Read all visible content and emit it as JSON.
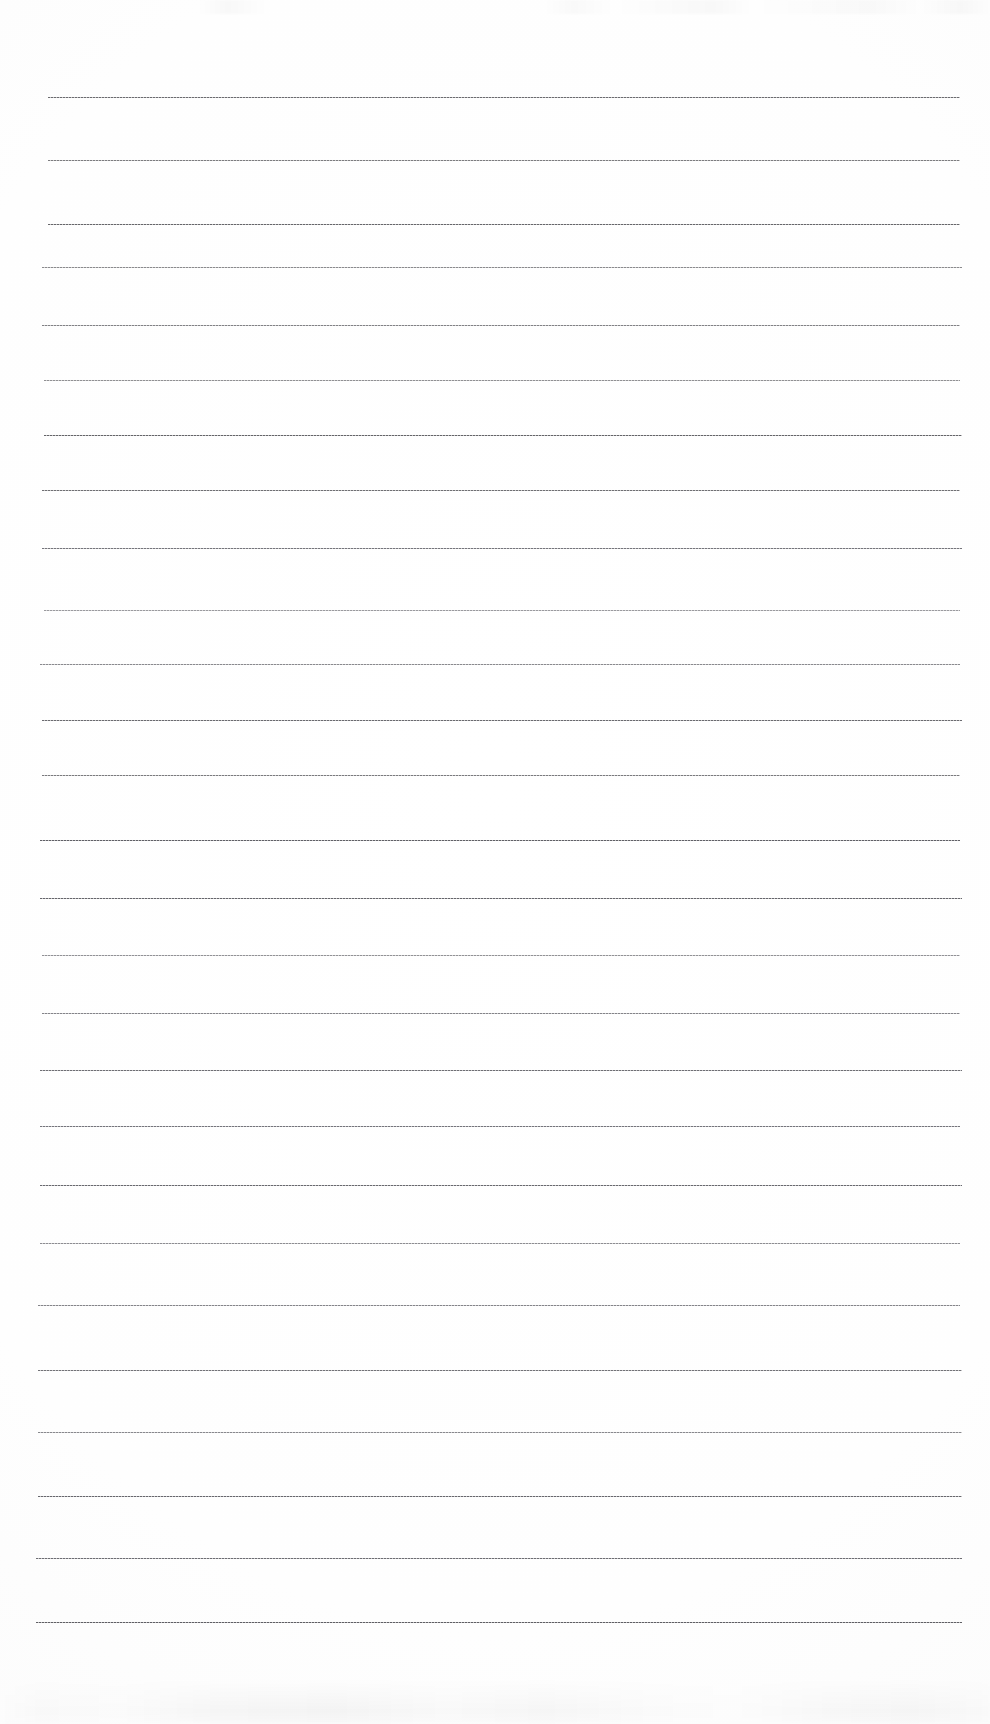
{
  "document": {
    "kind": "scanned-blank-ruled-paper",
    "page_label": "",
    "background_color": "#fefefe",
    "page_width": 990,
    "page_height": 1724,
    "text_content": "",
    "handwriting_present": "no",
    "printed_text_present": "no"
  },
  "ruling": {
    "line_count": 25,
    "first_line_y": 97,
    "line_spacing": 63.5,
    "line_left_x": 48,
    "line_right_x": 960,
    "line_thickness": 1,
    "line_color": "#6c6c70",
    "line_style": "fine dotted scan rule",
    "margin_rule_present": "no",
    "top_margin": 97,
    "bottom_margin": 102,
    "lines": [
      {
        "index": 1,
        "y": 97,
        "x1": 48,
        "x2": 960,
        "color": "#5f5f63",
        "opacity": 0.92
      },
      {
        "index": 2,
        "y": 160,
        "x1": 48,
        "x2": 960,
        "color": "#67676b",
        "opacity": 0.86
      },
      {
        "index": 3,
        "y": 224,
        "x1": 48,
        "x2": 960,
        "color": "#5d5d61",
        "opacity": 0.94
      },
      {
        "index": 4,
        "y": 267,
        "x1": 42,
        "x2": 962,
        "color": "#6e6e72",
        "opacity": 0.8
      },
      {
        "index": 5,
        "y": 325,
        "x1": 42,
        "x2": 960,
        "color": "#6a6a6e",
        "opacity": 0.84
      },
      {
        "index": 6,
        "y": 380,
        "x1": 44,
        "x2": 960,
        "color": "#727276",
        "opacity": 0.78
      },
      {
        "index": 7,
        "y": 435,
        "x1": 44,
        "x2": 962,
        "color": "#5c5c60",
        "opacity": 0.95
      },
      {
        "index": 8,
        "y": 490,
        "x1": 42,
        "x2": 960,
        "color": "#606064",
        "opacity": 0.9
      },
      {
        "index": 9,
        "y": 548,
        "x1": 42,
        "x2": 962,
        "color": "#63636a",
        "opacity": 0.88
      },
      {
        "index": 10,
        "y": 610,
        "x1": 44,
        "x2": 960,
        "color": "#74747a",
        "opacity": 0.72
      },
      {
        "index": 11,
        "y": 664,
        "x1": 40,
        "x2": 960,
        "color": "#6d6d73",
        "opacity": 0.8
      },
      {
        "index": 12,
        "y": 720,
        "x1": 42,
        "x2": 962,
        "color": "#5e5e63",
        "opacity": 0.92
      },
      {
        "index": 13,
        "y": 775,
        "x1": 42,
        "x2": 960,
        "color": "#656569",
        "opacity": 0.86
      },
      {
        "index": 14,
        "y": 840,
        "x1": 40,
        "x2": 960,
        "color": "#5a5a60",
        "opacity": 0.96
      },
      {
        "index": 15,
        "y": 898,
        "x1": 40,
        "x2": 962,
        "color": "#5c5c62",
        "opacity": 0.94
      },
      {
        "index": 16,
        "y": 955,
        "x1": 42,
        "x2": 960,
        "color": "#707076",
        "opacity": 0.76
      },
      {
        "index": 17,
        "y": 1013,
        "x1": 42,
        "x2": 960,
        "color": "#6a6a70",
        "opacity": 0.82
      },
      {
        "index": 18,
        "y": 1070,
        "x1": 40,
        "x2": 962,
        "color": "#5f5f65",
        "opacity": 0.9
      },
      {
        "index": 19,
        "y": 1126,
        "x1": 40,
        "x2": 960,
        "color": "#62626a",
        "opacity": 0.88
      },
      {
        "index": 20,
        "y": 1185,
        "x1": 40,
        "x2": 962,
        "color": "#5d5d64",
        "opacity": 0.93
      },
      {
        "index": 21,
        "y": 1243,
        "x1": 40,
        "x2": 960,
        "color": "#6e6e74",
        "opacity": 0.78
      },
      {
        "index": 22,
        "y": 1305,
        "x1": 38,
        "x2": 960,
        "color": "#6a6a70",
        "opacity": 0.82
      },
      {
        "index": 23,
        "y": 1370,
        "x1": 38,
        "x2": 962,
        "color": "#616167",
        "opacity": 0.89
      },
      {
        "index": 24,
        "y": 1432,
        "x1": 38,
        "x2": 962,
        "color": "#6b6b71",
        "opacity": 0.8
      },
      {
        "index": 25,
        "y": 1496,
        "x1": 38,
        "x2": 962,
        "color": "#5c5c63",
        "opacity": 0.93
      },
      {
        "index": 26,
        "y": 1558,
        "x1": 36,
        "x2": 962,
        "color": "#5f5f66",
        "opacity": 0.91
      },
      {
        "index": 27,
        "y": 1622,
        "x1": 36,
        "x2": 962,
        "color": "#59595f",
        "opacity": 0.96
      }
    ]
  },
  "artifacts": {
    "top_edge_speckle": "faint gray scanner speckle along the very top edge",
    "bottom_edge_smudge": "faint gray smudge band along the bottom edge",
    "page_edge_visible": "no"
  }
}
